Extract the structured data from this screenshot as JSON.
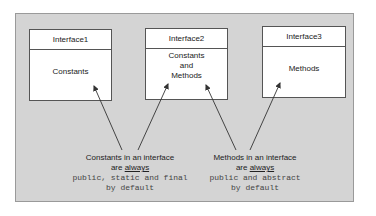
{
  "diagram": {
    "interfaces": [
      {
        "title": "Interface1",
        "body": [
          "Constants"
        ]
      },
      {
        "title": "Interface2",
        "body": [
          "Constants",
          "and",
          "Methods"
        ]
      },
      {
        "title": "Interface3",
        "body": [
          "Methods"
        ]
      }
    ],
    "notes": {
      "constants": {
        "line1": "Constants in an interface",
        "line2_prefix": "are ",
        "line2_emphasis": "always",
        "line3": "public, static and final",
        "line4": "by default"
      },
      "methods": {
        "line1": "Methods in an interface",
        "line2_prefix": "are ",
        "line2_emphasis": "always",
        "line3": "public and abstract",
        "line4": "by default"
      }
    },
    "colors": {
      "panel_background": "#d4d4d4",
      "box_background": "#ffffff",
      "arrow": "#333333"
    }
  }
}
